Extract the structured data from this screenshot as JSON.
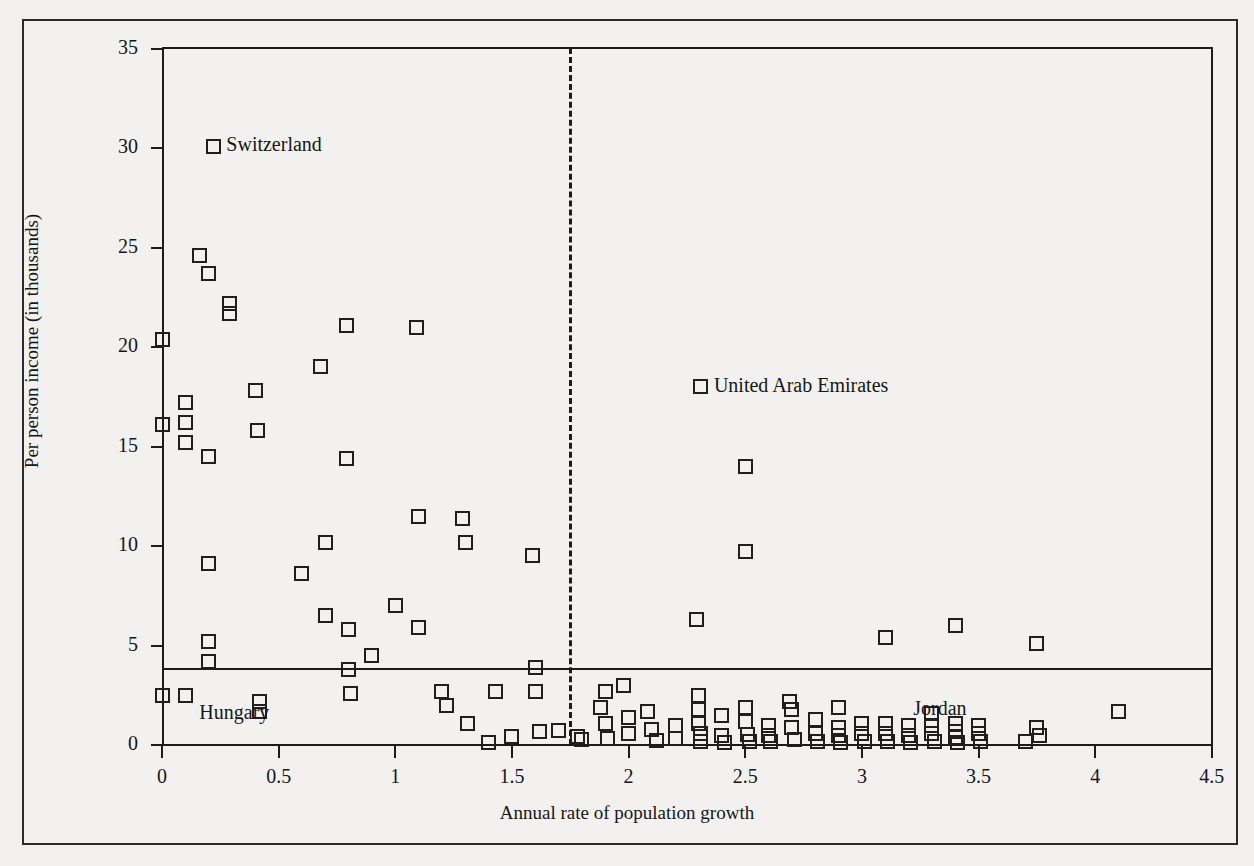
{
  "chart_data": {
    "type": "scatter",
    "title": "",
    "xlabel": "Annual rate of population growth",
    "ylabel": "Per person income (in thousands)",
    "xlim": [
      0,
      4.5
    ],
    "ylim": [
      0,
      35
    ],
    "xticks": [
      "0",
      "0.5",
      "1",
      "1.5",
      "2",
      "2.5",
      "3",
      "3.5",
      "4",
      "4.5"
    ],
    "xtick_values": [
      0,
      0.5,
      1,
      1.5,
      2,
      2.5,
      3,
      3.5,
      4,
      4.5
    ],
    "yticks": [
      "0",
      "5",
      "10",
      "15",
      "20",
      "25",
      "30",
      "35"
    ],
    "ytick_values": [
      0,
      5,
      10,
      15,
      20,
      25,
      30,
      35
    ],
    "grid": false,
    "legend": "none",
    "marker_style": "open-square",
    "reference_lines": [
      {
        "name": "income-threshold",
        "orientation": "horizontal",
        "value": 3.8,
        "style": "solid"
      },
      {
        "name": "growth-threshold",
        "orientation": "vertical",
        "value": 1.75,
        "style": "dashed"
      }
    ],
    "annotations": [
      {
        "label": "Switzerland",
        "x": 0.22,
        "y": 30.1,
        "marker": true
      },
      {
        "label": "United Arab Emirates",
        "x": 2.31,
        "y": 18.0,
        "marker": true
      },
      {
        "label": "Hungary",
        "x": 0.16,
        "y": 1.55,
        "marker": false
      },
      {
        "label": "Jordan",
        "x": 3.22,
        "y": 1.75,
        "marker": false
      }
    ],
    "points": [
      [
        0.0,
        20.4
      ],
      [
        0.0,
        16.1
      ],
      [
        0.0,
        2.5
      ],
      [
        0.1,
        17.2
      ],
      [
        0.1,
        16.2
      ],
      [
        0.1,
        15.2
      ],
      [
        0.1,
        2.5
      ],
      [
        0.16,
        24.6
      ],
      [
        0.2,
        23.7
      ],
      [
        0.2,
        14.5
      ],
      [
        0.2,
        9.1
      ],
      [
        0.2,
        5.2
      ],
      [
        0.2,
        4.2
      ],
      [
        0.29,
        22.2
      ],
      [
        0.29,
        21.7
      ],
      [
        0.4,
        17.8
      ],
      [
        0.41,
        15.8
      ],
      [
        0.42,
        2.2
      ],
      [
        0.42,
        1.7
      ],
      [
        0.6,
        8.6
      ],
      [
        0.68,
        19.0
      ],
      [
        0.7,
        10.2
      ],
      [
        0.7,
        6.5
      ],
      [
        0.79,
        21.1
      ],
      [
        0.79,
        14.4
      ],
      [
        0.8,
        5.8
      ],
      [
        0.8,
        3.8
      ],
      [
        0.81,
        2.6
      ],
      [
        0.9,
        4.5
      ],
      [
        1.0,
        7.0
      ],
      [
        1.09,
        21.0
      ],
      [
        1.1,
        11.5
      ],
      [
        1.1,
        5.9
      ],
      [
        1.2,
        2.7
      ],
      [
        1.22,
        2.0
      ],
      [
        1.29,
        11.4
      ],
      [
        1.3,
        10.2
      ],
      [
        1.31,
        1.1
      ],
      [
        1.4,
        0.15
      ],
      [
        1.43,
        2.7
      ],
      [
        1.5,
        0.45
      ],
      [
        1.59,
        9.5
      ],
      [
        1.6,
        3.9
      ],
      [
        1.6,
        2.7
      ],
      [
        1.62,
        0.7
      ],
      [
        1.7,
        0.75
      ],
      [
        1.78,
        0.45
      ],
      [
        1.8,
        0.3
      ],
      [
        1.88,
        1.9
      ],
      [
        1.9,
        2.7
      ],
      [
        1.9,
        1.1
      ],
      [
        1.91,
        0.35
      ],
      [
        1.98,
        3.0
      ],
      [
        2.0,
        1.4
      ],
      [
        2.0,
        0.6
      ],
      [
        2.08,
        1.7
      ],
      [
        2.1,
        0.8
      ],
      [
        2.12,
        0.25
      ],
      [
        2.2,
        1.0
      ],
      [
        2.2,
        0.35
      ],
      [
        2.29,
        6.3
      ],
      [
        2.3,
        2.5
      ],
      [
        2.3,
        1.8
      ],
      [
        2.3,
        1.1
      ],
      [
        2.31,
        0.6
      ],
      [
        2.31,
        0.2
      ],
      [
        2.4,
        1.5
      ],
      [
        2.4,
        0.5
      ],
      [
        2.41,
        0.15
      ],
      [
        2.5,
        14.0
      ],
      [
        2.5,
        9.7
      ],
      [
        2.5,
        1.9
      ],
      [
        2.5,
        1.2
      ],
      [
        2.51,
        0.55
      ],
      [
        2.52,
        0.2
      ],
      [
        2.6,
        1.0
      ],
      [
        2.6,
        0.5
      ],
      [
        2.61,
        0.2
      ],
      [
        2.69,
        2.2
      ],
      [
        2.7,
        1.8
      ],
      [
        2.7,
        0.9
      ],
      [
        2.71,
        0.3
      ],
      [
        2.8,
        1.3
      ],
      [
        2.8,
        0.6
      ],
      [
        2.81,
        0.2
      ],
      [
        2.9,
        1.9
      ],
      [
        2.9,
        0.9
      ],
      [
        2.9,
        0.5
      ],
      [
        2.91,
        0.15
      ],
      [
        3.0,
        1.1
      ],
      [
        3.0,
        0.6
      ],
      [
        3.01,
        0.2
      ],
      [
        3.1,
        5.4
      ],
      [
        3.1,
        1.1
      ],
      [
        3.1,
        0.6
      ],
      [
        3.11,
        0.2
      ],
      [
        3.2,
        1.0
      ],
      [
        3.2,
        0.5
      ],
      [
        3.21,
        0.15
      ],
      [
        3.3,
        1.6
      ],
      [
        3.3,
        1.0
      ],
      [
        3.3,
        0.6
      ],
      [
        3.31,
        0.2
      ],
      [
        3.4,
        6.0
      ],
      [
        3.4,
        1.1
      ],
      [
        3.4,
        0.7
      ],
      [
        3.4,
        0.4
      ],
      [
        3.41,
        0.15
      ],
      [
        3.5,
        1.0
      ],
      [
        3.5,
        0.6
      ],
      [
        3.51,
        0.2
      ],
      [
        3.7,
        0.2
      ],
      [
        3.75,
        5.1
      ],
      [
        3.75,
        0.9
      ],
      [
        3.76,
        0.5
      ],
      [
        4.1,
        1.7
      ]
    ]
  },
  "geometry": {
    "plot_left": 162,
    "plot_top": 48,
    "plot_width": 1050,
    "plot_height": 697,
    "x_origin_px": 162,
    "y_origin_px": 745,
    "px_per_x_unit": 233.3,
    "px_per_y_unit": 19.9
  }
}
